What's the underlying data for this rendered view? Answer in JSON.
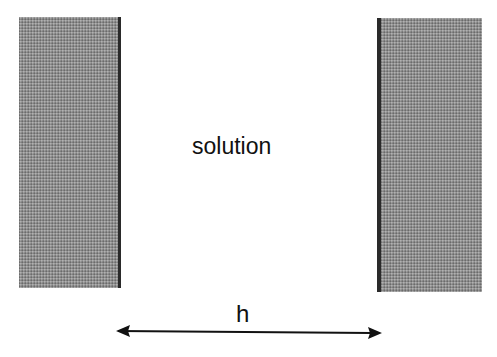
{
  "diagram": {
    "region_label": "solution",
    "distance_label": "h",
    "plates": [
      {
        "side": "left",
        "surface_edge": "right"
      },
      {
        "side": "right",
        "surface_edge": "left"
      }
    ],
    "arrow": {
      "type": "double-headed",
      "orientation": "horizontal"
    },
    "colors": {
      "plate_fill": "#8e8e8e",
      "plate_edge": "#2a2a2a",
      "text": "#111111"
    }
  }
}
